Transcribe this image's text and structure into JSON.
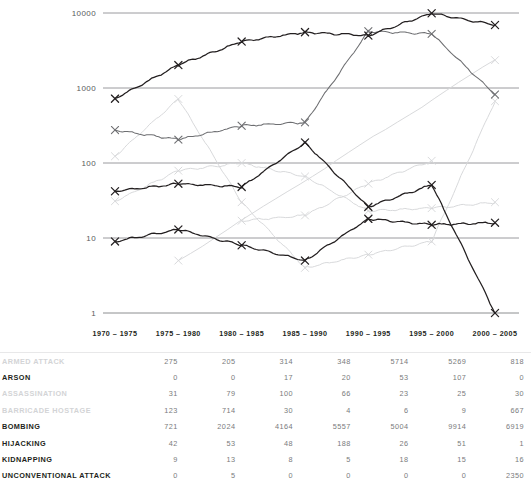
{
  "intro": {
    "title": "ONAL",
    "subtitle": "2005",
    "note_line1": "THOSE",
    "note_line2": "AD"
  },
  "chart": {
    "y_ticks": [
      "10000",
      "1000",
      "100",
      "10",
      "1"
    ],
    "x_labels": [
      "1970 – 1975",
      "1975 – 1980",
      "1980 – 1985",
      "1985 – 1990",
      "1990 – 1995",
      "1995 – 2000",
      "2000 – 2005"
    ],
    "line_color_dark": "#231f20",
    "line_color_mid": "#6d6e71",
    "line_color_light": "#d6d7d9",
    "grid_color": "#808285"
  },
  "chart_data": {
    "type": "line",
    "title": "",
    "xlabel": "",
    "ylabel": "",
    "yscale": "log",
    "ylim": [
      1,
      10000
    ],
    "grid": true,
    "legend": "none",
    "categories": [
      "1970 – 1975",
      "1975 – 1980",
      "1980 – 1985",
      "1985 – 1990",
      "1990 – 1995",
      "1995 – 2000",
      "2000 – 2005"
    ],
    "series": [
      {
        "name": "ARMED ATTACK",
        "shade": "mid",
        "values": [
          275,
          205,
          314,
          348,
          5714,
          5269,
          818
        ]
      },
      {
        "name": "ARSON",
        "shade": "light",
        "values": [
          0,
          0,
          17,
          20,
          53,
          107,
          0
        ]
      },
      {
        "name": "ASSASSINATION",
        "shade": "light",
        "values": [
          31,
          79,
          100,
          66,
          23,
          25,
          30
        ]
      },
      {
        "name": "BARRICADE HOSTAGE",
        "shade": "light",
        "values": [
          123,
          714,
          30,
          4,
          6,
          9,
          667
        ]
      },
      {
        "name": "BOMBING",
        "shade": "dark",
        "values": [
          721,
          2024,
          4164,
          5557,
          5004,
          9914,
          6919
        ]
      },
      {
        "name": "HIJACKING",
        "shade": "dark",
        "values": [
          42,
          53,
          48,
          188,
          26,
          51,
          1
        ]
      },
      {
        "name": "KIDNAPPING",
        "shade": "dark",
        "values": [
          9,
          13,
          8,
          5,
          18,
          15,
          16
        ]
      },
      {
        "name": "UNCONVENTIONAL ATTACK",
        "shade": "light",
        "values": [
          0,
          5,
          0,
          0,
          0,
          0,
          2350
        ]
      }
    ]
  },
  "table": {
    "rows": [
      {
        "label": "ARMED ATTACK",
        "values": [
          "275",
          "205",
          "314",
          "348",
          "5714",
          "5269",
          "818"
        ]
      },
      {
        "label": "ARSON",
        "values": [
          "0",
          "0",
          "17",
          "20",
          "53",
          "107",
          "0"
        ]
      },
      {
        "label": "ASSASSINATION",
        "values": [
          "31",
          "79",
          "100",
          "66",
          "23",
          "25",
          "30"
        ]
      },
      {
        "label": "BARRICADE HOSTAGE",
        "values": [
          "123",
          "714",
          "30",
          "4",
          "6",
          "9",
          "667"
        ]
      },
      {
        "label": "BOMBING",
        "values": [
          "721",
          "2024",
          "4164",
          "5557",
          "5004",
          "9914",
          "6919"
        ]
      },
      {
        "label": "HIJACKING",
        "values": [
          "42",
          "53",
          "48",
          "188",
          "26",
          "51",
          "1"
        ]
      },
      {
        "label": "KIDNAPPING",
        "values": [
          "9",
          "13",
          "8",
          "5",
          "18",
          "15",
          "16"
        ]
      },
      {
        "label": "UNCONVENTIONAL ATTACK",
        "values": [
          "0",
          "5",
          "0",
          "0",
          "0",
          "0",
          "2350"
        ]
      }
    ]
  }
}
